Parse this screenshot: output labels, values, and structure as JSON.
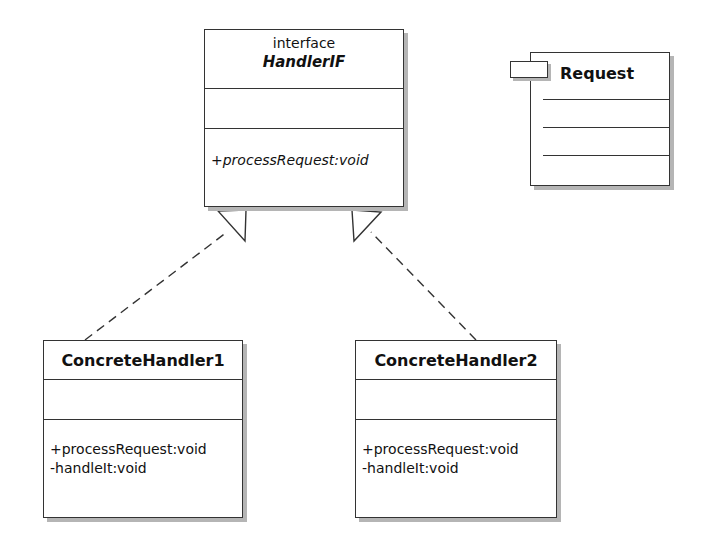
{
  "diagram": {
    "type": "uml-class-diagram",
    "interface": {
      "stereotype": "interface",
      "name": "HandlerIF",
      "attributes": [],
      "operations": [
        "+processRequest:void"
      ]
    },
    "classes": [
      {
        "name": "ConcreteHandler1",
        "attributes": [],
        "operations": [
          "+processRequest:void",
          "-handleIt:void"
        ]
      },
      {
        "name": "ConcreteHandler2",
        "attributes": [],
        "operations": [
          "+processRequest:void",
          "-handleIt:void"
        ]
      }
    ],
    "package": {
      "name": "Request"
    },
    "relations": [
      {
        "from": "ConcreteHandler1",
        "to": "HandlerIF",
        "kind": "realization"
      },
      {
        "from": "ConcreteHandler2",
        "to": "HandlerIF",
        "kind": "realization"
      }
    ],
    "colors": {
      "line": "#333333",
      "shadow": "#b5b5b5",
      "background": "#ffffff"
    }
  }
}
